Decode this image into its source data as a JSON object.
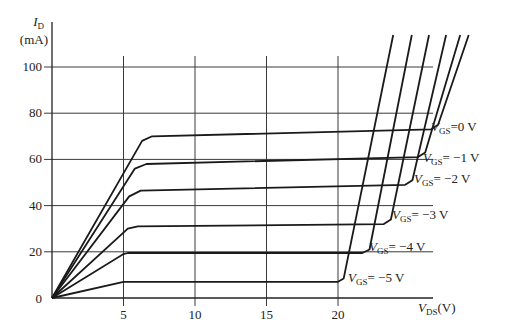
{
  "chart_data": {
    "type": "line",
    "title": "",
    "xlabel": "V_DS(V)",
    "ylabel": "I_D (mA)",
    "ylabel_parts": {
      "symbol": "I",
      "sub": "D",
      "unit": "(mA)"
    },
    "xlabel_parts": {
      "symbol": "V",
      "sub": "DS",
      "unit": "(V)"
    },
    "xlim": [
      0,
      27
    ],
    "ylim": [
      0,
      110
    ],
    "x_ticks": [
      0,
      5,
      10,
      15,
      20
    ],
    "x_tick_labels": [
      "5",
      "10",
      "15",
      "20"
    ],
    "y_ticks": [
      0,
      20,
      40,
      60,
      80,
      100
    ],
    "y_tick_labels": [
      "0",
      "20",
      "40",
      "60",
      "80",
      "100"
    ],
    "grid": true,
    "series": [
      {
        "name": "V_GS = 0 V",
        "label": "=0 V",
        "points": [
          [
            0,
            0
          ],
          [
            6.3,
            68
          ],
          [
            7,
            70
          ],
          [
            26.5,
            73
          ],
          [
            27,
            75
          ],
          [
            29.2,
            115
          ]
        ]
      },
      {
        "name": "V_GS = -1 V",
        "label": "= −1 V",
        "points": [
          [
            0,
            0
          ],
          [
            5.8,
            56
          ],
          [
            6.6,
            58
          ],
          [
            25.6,
            61
          ],
          [
            26.1,
            63
          ],
          [
            28.6,
            115
          ]
        ]
      },
      {
        "name": "V_GS = -2 V",
        "label": "= −2 V",
        "points": [
          [
            0,
            0
          ],
          [
            5.4,
            44
          ],
          [
            6.2,
            46.5
          ],
          [
            24.7,
            49
          ],
          [
            25.2,
            51
          ],
          [
            27.6,
            115
          ]
        ]
      },
      {
        "name": "V_GS = -3 V",
        "label": "= −3 V",
        "points": [
          [
            0,
            0
          ],
          [
            5.3,
            30
          ],
          [
            6,
            31
          ],
          [
            23.2,
            32
          ],
          [
            23.7,
            34
          ],
          [
            26.4,
            115
          ]
        ]
      },
      {
        "name": "V_GS = -4 V",
        "label": "= −4 V",
        "points": [
          [
            0,
            0
          ],
          [
            5,
            19
          ],
          [
            5.3,
            19.5
          ],
          [
            21.7,
            19.5
          ],
          [
            22.2,
            21
          ],
          [
            25.2,
            115
          ]
        ]
      },
      {
        "name": "V_GS = -5 V",
        "label": "= −5 V",
        "points": [
          [
            0,
            0
          ],
          [
            5,
            7
          ],
          [
            20,
            7
          ],
          [
            20.4,
            8.5
          ],
          [
            23.9,
            115
          ]
        ]
      }
    ],
    "annotations": [
      {
        "text": "V_GS=0 V",
        "x": 26.9,
        "y": 74
      },
      {
        "text": "V_GS=-1 V",
        "x": 26.0,
        "y": 60
      },
      {
        "text": "V_GS=-2 V",
        "x": 25.0,
        "y": 50
      },
      {
        "text": "V_GS=-3 V",
        "x": 23.6,
        "y": 35
      },
      {
        "text": "V_GS=-4 V",
        "x": 22.5,
        "y": 20
      },
      {
        "text": "V_GS=-5 V",
        "x": 20.8,
        "y": 8
      }
    ],
    "legend_position": "inline-labels"
  },
  "labels": {
    "gs_sub": "GS",
    "v": "V"
  }
}
